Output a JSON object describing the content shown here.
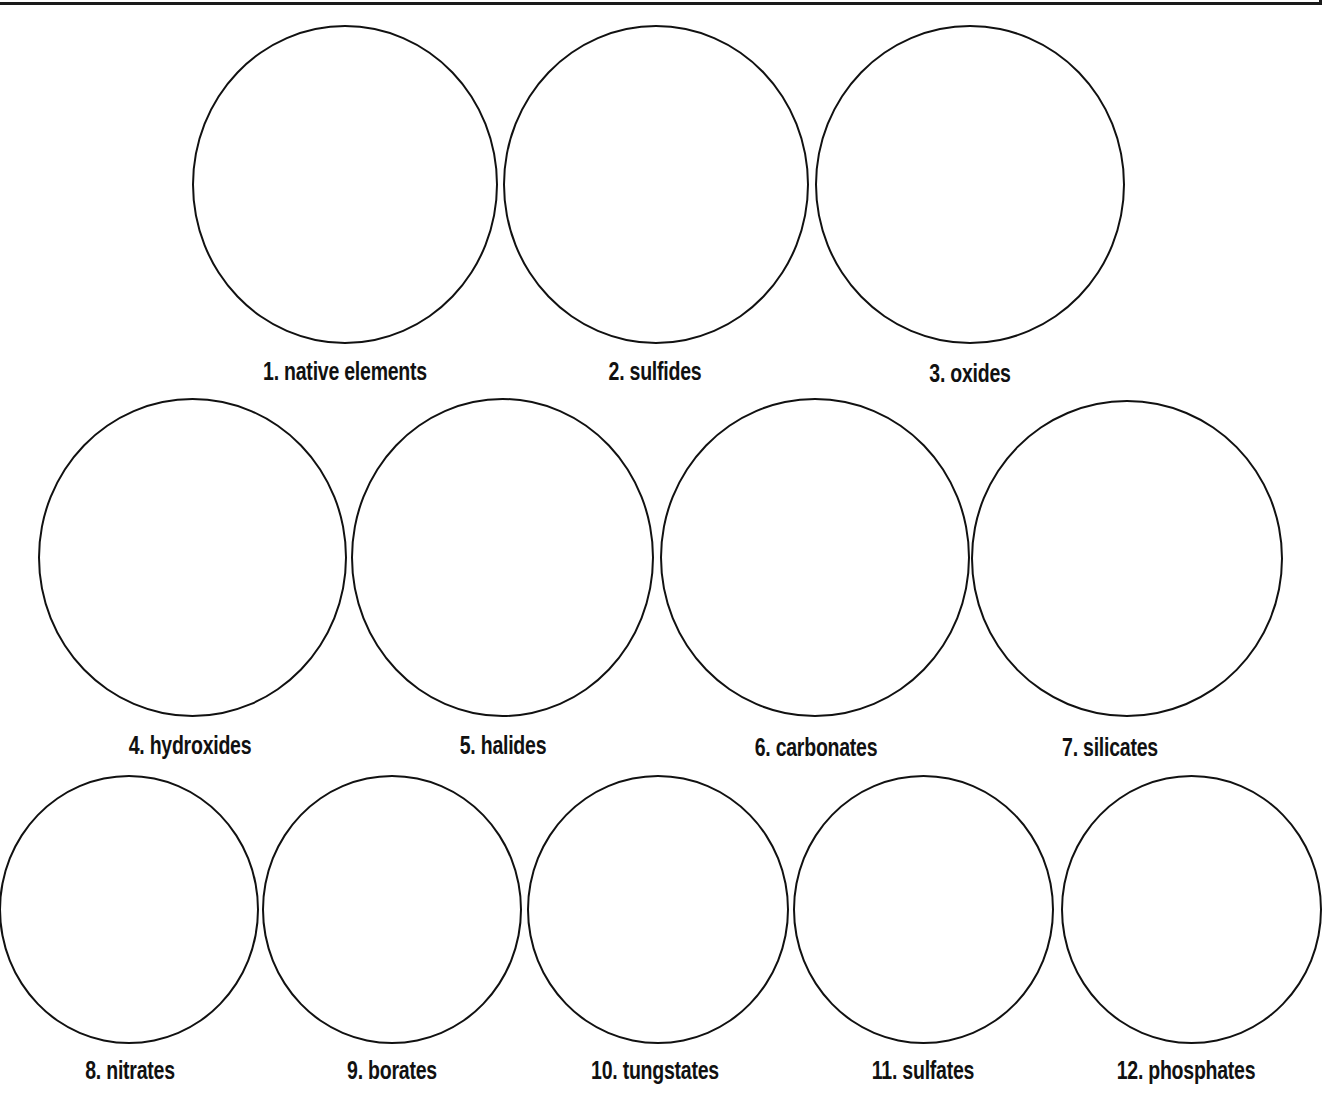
{
  "worksheet": {
    "title": "",
    "mineral_groups": [
      {
        "number": "1.",
        "name": "native elements",
        "label": "1. native elements"
      },
      {
        "number": "2.",
        "name": "sulfides",
        "label": "2. sulfides"
      },
      {
        "number": "3.",
        "name": "oxides",
        "label": "3. oxides"
      },
      {
        "number": "4.",
        "name": "hydroxides",
        "label": "4. hydroxides"
      },
      {
        "number": "5.",
        "name": "halides",
        "label": "5. halides"
      },
      {
        "number": "6.",
        "name": "carbonates",
        "label": "6. carbonates"
      },
      {
        "number": "7.",
        "name": "silicates",
        "label": "7. silicates"
      },
      {
        "number": "8.",
        "name": "nitrates",
        "label": "8. nitrates"
      },
      {
        "number": "9.",
        "name": "borates",
        "label": "9. borates"
      },
      {
        "number": "10.",
        "name": "tungstates",
        "label": "10. tungstates"
      },
      {
        "number": "11.",
        "name": "sulfates",
        "label": "11. sulfates"
      },
      {
        "number": "12.",
        "name": "phosphates",
        "label": "12. phosphates"
      }
    ]
  }
}
